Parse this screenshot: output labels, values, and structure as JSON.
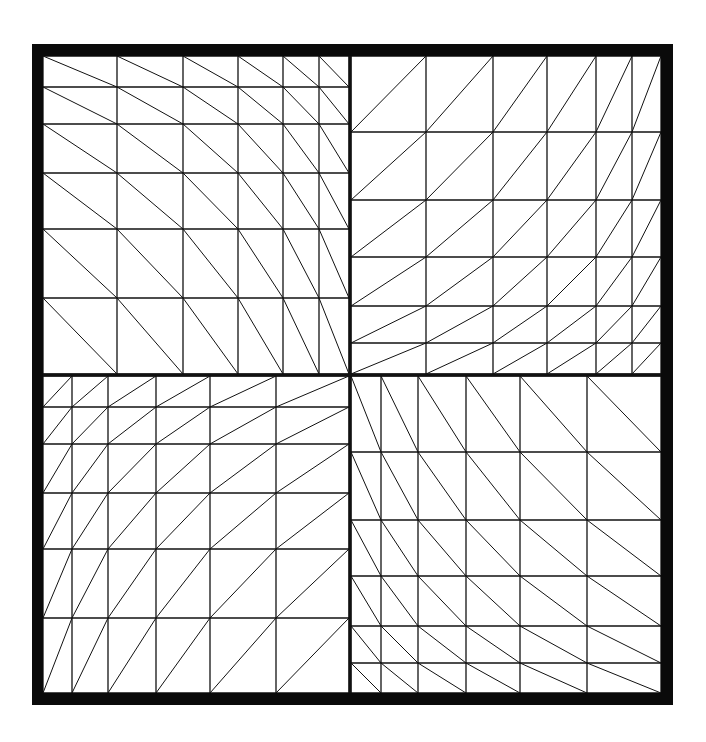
{
  "figure": {
    "type": "structured triangular mesh, four quadrants with graded spacing",
    "width": 706,
    "height": 742,
    "colors": {
      "background": "#ffffff",
      "line": "#111111",
      "frame": "#0a0a0a"
    },
    "frame": {
      "outer": [
        32,
        44,
        673,
        705
      ],
      "inner": [
        43,
        56,
        661,
        693
      ]
    },
    "divider": {
      "x": 350,
      "y": 375,
      "width": 3
    },
    "quadrants": [
      {
        "name": "top-left",
        "xs": [
          43,
          117,
          183,
          238,
          283,
          319,
          349
        ],
        "ys": [
          56,
          87,
          124,
          173,
          229,
          298,
          374
        ],
        "diagonal": "down-right"
      },
      {
        "name": "top-right",
        "xs": [
          351,
          426,
          493,
          547,
          596,
          632,
          661
        ],
        "ys": [
          56,
          132,
          200,
          257,
          306,
          343,
          374
        ],
        "diagonal": "up-right"
      },
      {
        "name": "bottom-left",
        "xs": [
          43,
          72,
          108,
          156,
          210,
          276,
          349
        ],
        "ys": [
          376,
          407,
          444,
          493,
          549,
          618,
          693
        ],
        "diagonal": "up-right"
      },
      {
        "name": "bottom-right",
        "xs": [
          351,
          381,
          418,
          466,
          520,
          587,
          661
        ],
        "ys": [
          376,
          452,
          520,
          576,
          626,
          663,
          693
        ],
        "diagonal": "down-right"
      }
    ]
  }
}
